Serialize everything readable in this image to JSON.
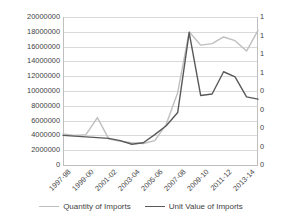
{
  "chart_data": {
    "type": "line",
    "title": "",
    "xlabel": "",
    "ylabel": "",
    "grid": true,
    "legend_position": "bottom",
    "categories": [
      "1997-98",
      "1998-99",
      "1999-00",
      "2000-01",
      "2001-02",
      "2002-03",
      "2003-04",
      "2004-05",
      "2005-06",
      "2006-07",
      "2007-08",
      "2008-09",
      "2009-10",
      "2010-11",
      "2011-12",
      "2012-13",
      "2013-14",
      "2014-15"
    ],
    "x_tick_labels": [
      "1997-98",
      "1999-00",
      "2001-02",
      "2003-04",
      "2005-06",
      "2007-08",
      "2009-10",
      "2011-12",
      "2013-14"
    ],
    "left_axis": {
      "tick_labels": [
        "20000000",
        "18000000",
        "16000000",
        "14000000",
        "12000000",
        "10000000",
        "8000000",
        "6000000",
        "4000000",
        "2000000",
        "0"
      ],
      "ylim": [
        0,
        20000000
      ]
    },
    "right_axis": {
      "tick_labels": [
        "1",
        "1",
        "1",
        "1",
        "0",
        "0",
        "0",
        "0",
        "0"
      ],
      "note": "right axis labels truncated at image edge; only leading digit visible"
    },
    "series": [
      {
        "name": "Quantity of Imports",
        "color": "#bfbfbf",
        "axis": "left",
        "values": [
          4200000,
          4000000,
          4100000,
          6400000,
          3500000,
          3200000,
          3000000,
          2900000,
          3300000,
          5500000,
          9800000,
          18000000,
          16200000,
          16400000,
          17300000,
          16800000,
          15400000,
          18200000
        ]
      },
      {
        "name": "Unit Value of Imports",
        "color": "#595959",
        "axis": "right",
        "values": [
          4000000,
          3900000,
          3800000,
          3700000,
          3600000,
          3300000,
          2800000,
          3000000,
          4100000,
          5300000,
          7100000,
          17900000,
          9400000,
          9600000,
          12600000,
          11900000,
          9200000,
          8900000
        ]
      }
    ]
  },
  "legend": {
    "entries": [
      {
        "label": "Quantity of Imports",
        "color": "#bfbfbf"
      },
      {
        "label": "Unit Value of Imports",
        "color": "#595959"
      }
    ]
  }
}
